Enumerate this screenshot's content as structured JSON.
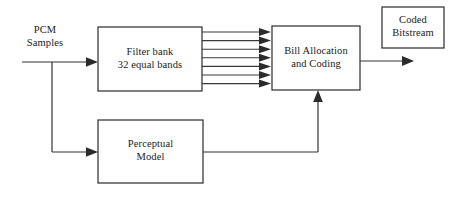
{
  "diagram": {
    "type": "block-diagram",
    "background_color": "#ffffff",
    "line_color": "#333333",
    "text_color": "#1a1a1a",
    "blocks": [
      {
        "id": "filter-bank",
        "label": "Filter bank\n32 equal bands",
        "x": 98,
        "y": 27,
        "width": 104,
        "height": 64
      },
      {
        "id": "bit-allocation",
        "label": "Bill Allocation\nand Coding",
        "x": 272,
        "y": 26,
        "width": 88,
        "height": 64
      },
      {
        "id": "coded-bitstream",
        "label": "Coded\nBitstream",
        "x": 382,
        "y": 7,
        "width": 62,
        "height": 41
      },
      {
        "id": "perceptual-model",
        "label": "Perceptual\nModel",
        "x": 98,
        "y": 120,
        "width": 105,
        "height": 63
      }
    ],
    "labels": [
      {
        "id": "pcm-samples",
        "text": "PCM\nSamples",
        "x": 17,
        "y": 24,
        "width": 56
      }
    ],
    "connections": [
      {
        "id": "pcm-input-to-filter-bank",
        "from": "PCM Samples",
        "to": "Filter bank",
        "arrow": true
      },
      {
        "id": "pcm-branch-to-perceptual-model",
        "from": "PCM Samples",
        "to": "Perceptual Model",
        "arrow": true
      },
      {
        "id": "subbands-to-bit-allocation",
        "from": "Filter bank",
        "to": "Bill Allocation and Coding",
        "arrow": true,
        "line_count": 7
      },
      {
        "id": "bit-allocation-to-output",
        "from": "Bill Allocation and Coding",
        "to": "output",
        "arrow": true
      },
      {
        "id": "perceptual-model-to-bit-allocation",
        "from": "Perceptual Model",
        "to": "Bill Allocation and Coding",
        "arrow": true
      }
    ],
    "subband_lines": {
      "count": 7,
      "start_x": 202,
      "end_x": 272,
      "top_y": 32,
      "spacing": 8.6
    }
  }
}
